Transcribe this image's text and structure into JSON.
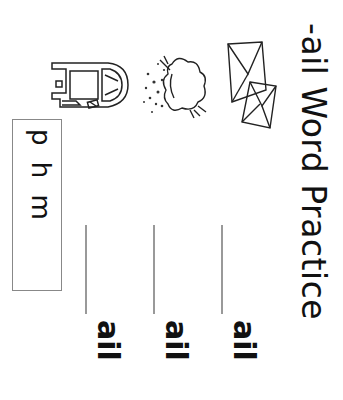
{
  "worksheet": {
    "title": "-ail Word Practice",
    "letter_bank": {
      "letters": "p h m"
    },
    "pictures": [
      {
        "name": "mail-truck-picture"
      },
      {
        "name": "hail-picture"
      },
      {
        "name": "mail-envelopes-picture"
      }
    ],
    "rows": [
      {
        "blank": "",
        "ending": "ail"
      },
      {
        "blank": "",
        "ending": "ail"
      },
      {
        "blank": "",
        "ending": "ail"
      }
    ]
  }
}
